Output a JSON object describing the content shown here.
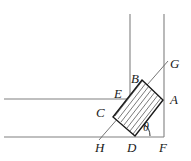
{
  "figure": {
    "canvas": {
      "width": 191,
      "height": 161,
      "background": "#ffffff"
    },
    "colors": {
      "wall_line": "#808080",
      "shape_outline": "#1a1a1a",
      "hatch_line": "#4d4d4d",
      "guide_line": "#666666",
      "label_text": "#1a1a1a"
    },
    "labels": [
      {
        "id": "G",
        "text": "G",
        "x": 170,
        "y": 57
      },
      {
        "id": "B",
        "text": "B",
        "x": 131,
        "y": 72
      },
      {
        "id": "A",
        "text": "A",
        "x": 170,
        "y": 93
      },
      {
        "id": "E",
        "text": "E",
        "x": 114,
        "y": 87
      },
      {
        "id": "C",
        "text": "C",
        "x": 96,
        "y": 106
      },
      {
        "id": "H",
        "text": "H",
        "x": 95,
        "y": 141
      },
      {
        "id": "D",
        "text": "D",
        "x": 127,
        "y": 141
      },
      {
        "id": "F",
        "text": "F",
        "x": 159,
        "y": 141
      }
    ],
    "angle": {
      "symbol": "θ",
      "x": 143,
      "y": 121,
      "vertex": "D"
    },
    "geometry": {
      "rect_vertices": {
        "A": [
          163,
          100
        ],
        "B": [
          142,
          80
        ],
        "C": [
          113,
          117
        ],
        "D": [
          135,
          136
        ]
      },
      "guide_line": {
        "from": [
          99,
          140
        ],
        "to": [
          168,
          61
        ],
        "label_from": "H",
        "label_to": "G"
      },
      "walls": {
        "vertical_inner_x": 130,
        "vertical_outer_x": 164,
        "horizontal_upper_y": 99,
        "horizontal_lower_y": 137,
        "left_edge_x": 4,
        "top_edge_y": 14
      },
      "hatch": {
        "spacing": 4,
        "direction": "parallel-to-long-axis"
      }
    }
  }
}
